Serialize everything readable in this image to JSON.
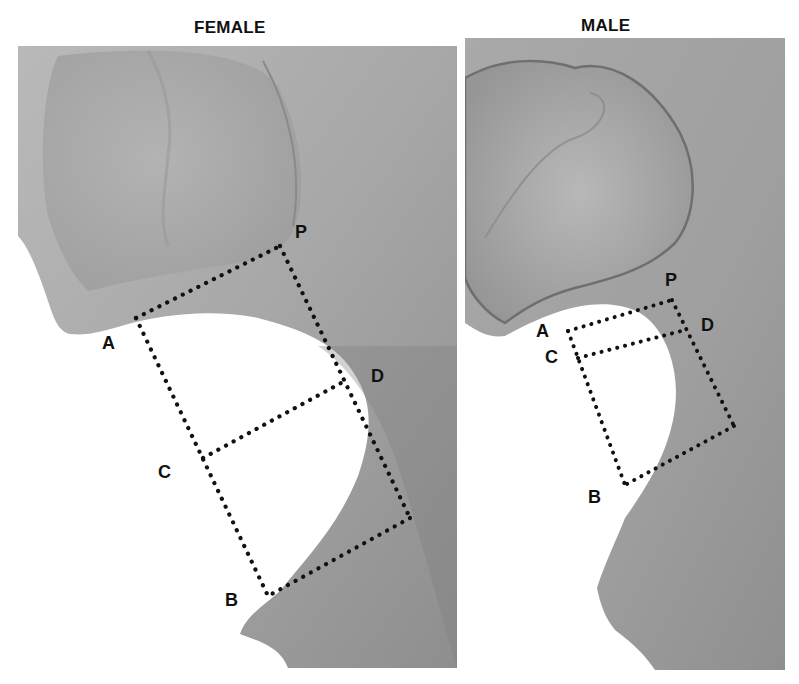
{
  "figure": {
    "panels": [
      {
        "title": "FEMALE",
        "labels": {
          "P": "P",
          "A": "A",
          "D": "D",
          "C": "C",
          "B": "B"
        }
      },
      {
        "title": "MALE",
        "labels": {
          "P": "P",
          "A": "A",
          "D": "D",
          "C": "C",
          "B": "B"
        }
      }
    ],
    "line_style": "dotted",
    "line_color": "#111111",
    "background": "#ffffff",
    "bone_color": "#a8a8a8"
  }
}
